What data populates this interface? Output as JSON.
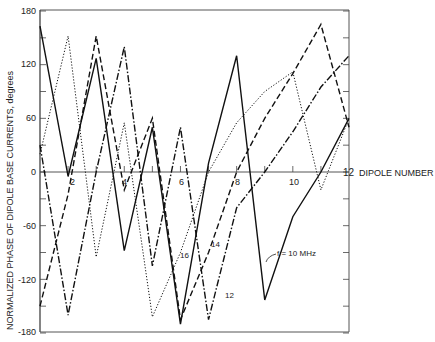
{
  "chart_data": {
    "type": "line",
    "title": "",
    "xlabel": "DIPOLE NUMBER",
    "ylabel": "NORMALIZED PHASE OF DIPOLE BASE CURRENTS, degrees",
    "x": [
      1,
      2,
      3,
      4,
      5,
      6,
      7,
      8,
      9,
      10,
      11,
      12
    ],
    "xlim": [
      1,
      12
    ],
    "ylim": [
      -180,
      180
    ],
    "x_ticks": [
      2,
      4,
      6,
      8,
      10,
      12
    ],
    "y_ticks": [
      180,
      120,
      60,
      0,
      -60,
      -120,
      -180
    ],
    "grid": false,
    "series": [
      {
        "name": "f = 10 MHz",
        "style": "solid",
        "values": [
          163,
          -5,
          127,
          -88,
          50,
          -170,
          10,
          130,
          -143,
          -50,
          0,
          60
        ]
      },
      {
        "name": "12",
        "style": "dash-dot",
        "values": [
          30,
          -160,
          0,
          140,
          -105,
          50,
          -165,
          -40,
          0,
          45,
          95,
          130
        ]
      },
      {
        "name": "14",
        "style": "dashed",
        "values": [
          -150,
          -25,
          152,
          -20,
          60,
          -165,
          -90,
          0,
          60,
          110,
          165,
          50
        ]
      },
      {
        "name": "16",
        "style": "dotted",
        "values": [
          20,
          152,
          -95,
          55,
          -162,
          -90,
          0,
          55,
          90,
          112,
          -20,
          60
        ]
      }
    ],
    "annotations": [
      {
        "text": "f = 10 MHz",
        "x": 9.5,
        "y": -120
      },
      {
        "text": "12",
        "x": 7.0,
        "y": -130
      },
      {
        "text": "14",
        "x": 6.8,
        "y": -75
      },
      {
        "text": "16",
        "x": 5.9,
        "y": -88
      }
    ]
  },
  "labels": {
    "xlabel": "DIPOLE NUMBER",
    "ylabel": "NORMALIZED PHASE OF DIPOLE BASE CURRENTS, degrees",
    "y180": "180",
    "y120": "120",
    "y60": "60",
    "y0": "0",
    "yn60": "-60",
    "yn120": "-120",
    "yn180": "-180",
    "x2": "2",
    "x4": "4",
    "x6": "6",
    "x8": "8",
    "x10": "10",
    "x12": "12",
    "ann10": "f = 10 MHz",
    "ann12": "12",
    "ann14": "14",
    "ann16": "16"
  }
}
